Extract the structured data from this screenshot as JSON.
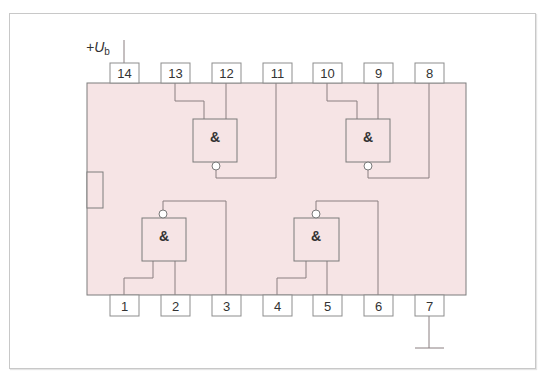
{
  "diagram": {
    "supply_label": "+U",
    "supply_subscript": "b",
    "body_color": "#f6e4e5",
    "wire_color": "#8a7f80",
    "top_pins": [
      "14",
      "13",
      "12",
      "11",
      "10",
      "9",
      "8"
    ],
    "bottom_pins": [
      "1",
      "2",
      "3",
      "4",
      "5",
      "6",
      "7"
    ],
    "gates": [
      {
        "id": "gate-1",
        "symbol": "&",
        "type": "NAND",
        "inputs": [
          "13",
          "12"
        ],
        "output": "11"
      },
      {
        "id": "gate-2",
        "symbol": "&",
        "type": "NAND",
        "inputs": [
          "10",
          "9"
        ],
        "output": "8"
      },
      {
        "id": "gate-3",
        "symbol": "&",
        "type": "NAND",
        "inputs": [
          "1",
          "2"
        ],
        "output": "3"
      },
      {
        "id": "gate-4",
        "symbol": "&",
        "type": "NAND",
        "inputs": [
          "4",
          "5"
        ],
        "output": "6"
      }
    ],
    "supply_pin": "14",
    "ground_pin": "7"
  }
}
